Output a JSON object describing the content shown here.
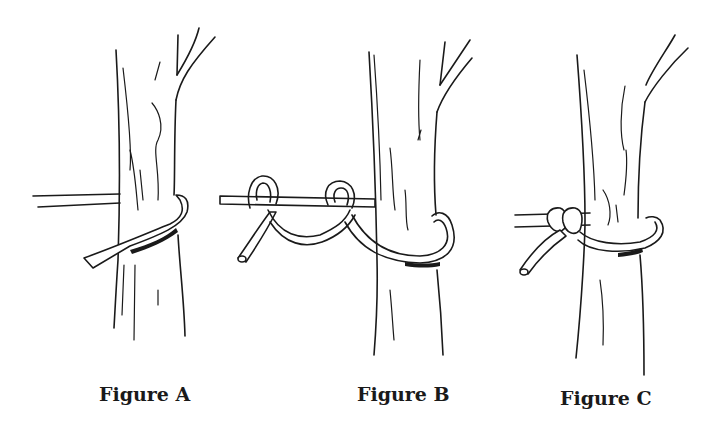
{
  "figures": [
    {
      "id": "A",
      "caption": "Figure A",
      "step": "rope passed around tree trunk"
    },
    {
      "id": "B",
      "caption": "Figure B",
      "step": "two half hitches formed around standing part"
    },
    {
      "id": "C",
      "caption": "Figure C",
      "step": "hitches tightened against the trunk"
    }
  ],
  "colors": {
    "ink": "#1a1a1a",
    "background": "#ffffff"
  }
}
